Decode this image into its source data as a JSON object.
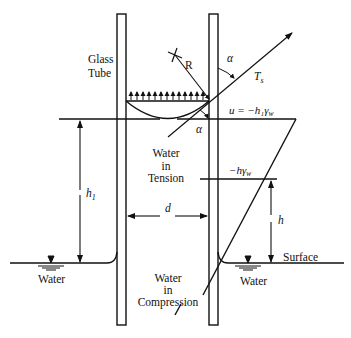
{
  "labels": {
    "glass_line1": "Glass",
    "glass_line2": "Tube",
    "radius": "R",
    "alpha_top": "α",
    "alpha_bottom": "α",
    "tension_force": "T",
    "tension_sub": "s",
    "pressure_top": "u = −h₁γ",
    "pressure_top_sub": "w",
    "pressure_mid": "−hγ",
    "pressure_mid_sub": "w",
    "water_tension_1": "Water",
    "water_tension_2": "in",
    "water_tension_3": "Tension",
    "h1": "h",
    "h1_sub": "1",
    "d": "d",
    "h": "h",
    "surface": "Surface",
    "water_left": "Water",
    "water_right": "Water",
    "water_compression_1": "Water",
    "water_compression_2": "in",
    "water_compression_3": "Compression"
  },
  "colors": {
    "ink": "#111111",
    "background": "#ffffff"
  }
}
